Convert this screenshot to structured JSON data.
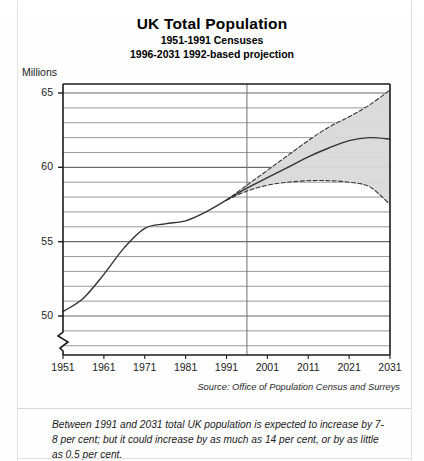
{
  "title": {
    "main": "UK Total Population",
    "sub1": "1951-1991 Censuses",
    "sub2": "1996-2031 1992-based projection"
  },
  "axis": {
    "units_label": "Millions",
    "y_ticks": [
      "50",
      "55",
      "60",
      "65"
    ],
    "x_ticks": [
      "1951",
      "1961",
      "1971",
      "1981",
      "1991",
      "2001",
      "2011",
      "2021",
      "2031"
    ]
  },
  "source": "Source: Office of Population Census and Surreys",
  "footnote": "Between 1991 and 2031 total UK population is expected to increase by 7-8 per cent; but it could increase by as much as 14 per cent, or by as little as 0.5 per cent.",
  "colors": {
    "band_fill": "#d9d9d9",
    "line": "#333333",
    "grid": "#7d7d7d",
    "frame": "#1b1b1b",
    "page": "#fefefe"
  },
  "chart_data": {
    "type": "line",
    "title": "UK Total Population",
    "subtitle": "1951-1991 Censuses; 1996-2031 1992-based projection",
    "xlabel": "",
    "ylabel": "Millions",
    "xlim": [
      1951,
      2031
    ],
    "ylim": [
      49,
      66
    ],
    "y_axis_break_below": 49,
    "grid": true,
    "grid_major_step": 5,
    "grid_minor_step": 1,
    "legend_position": "none",
    "projection_divider_x": 1996,
    "annotations": [
      {
        "text": "Censuses period",
        "x_range": [
          1951,
          1991
        ]
      },
      {
        "text": "1992-based projection period",
        "x_range": [
          1996,
          2031
        ]
      }
    ],
    "series": [
      {
        "name": "Census (actual)",
        "style": "solid",
        "x": [
          1951,
          1956,
          1961,
          1966,
          1971,
          1976,
          1981,
          1986,
          1991
        ],
        "values": [
          50.3,
          51.2,
          52.8,
          54.6,
          55.9,
          56.2,
          56.4,
          57.0,
          57.8
        ]
      },
      {
        "name": "Principal projection",
        "style": "solid",
        "x": [
          1991,
          1996,
          2001,
          2006,
          2011,
          2016,
          2021,
          2026,
          2031
        ],
        "values": [
          57.8,
          58.6,
          59.3,
          60.0,
          60.7,
          61.3,
          61.8,
          62.0,
          61.9
        ]
      },
      {
        "name": "High variant projection",
        "style": "dashed",
        "x": [
          1991,
          1996,
          2001,
          2006,
          2011,
          2016,
          2021,
          2026,
          2031
        ],
        "values": [
          57.8,
          58.8,
          59.8,
          60.8,
          61.8,
          62.7,
          63.4,
          64.2,
          65.2
        ]
      },
      {
        "name": "Low variant projection",
        "style": "dashed",
        "x": [
          1991,
          1996,
          2001,
          2006,
          2011,
          2016,
          2021,
          2026,
          2031
        ],
        "values": [
          57.8,
          58.4,
          58.8,
          59.0,
          59.1,
          59.1,
          59.0,
          58.7,
          57.5
        ]
      }
    ],
    "band": {
      "name": "Projection range (high-low)",
      "fill": "#d9d9d9",
      "upper_series": "High variant projection",
      "lower_series": "Low variant projection"
    }
  }
}
